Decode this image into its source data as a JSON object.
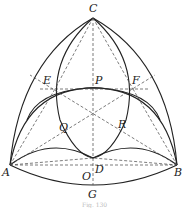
{
  "figure": {
    "caption": "Fig. 130",
    "points": {
      "A": {
        "label": "A",
        "x": 10,
        "y": 165
      },
      "B": {
        "label": "B",
        "x": 177,
        "y": 165
      },
      "C": {
        "label": "C",
        "x": 93,
        "y": 18
      },
      "D": {
        "label": "D",
        "x": 93,
        "y": 158
      },
      "E": {
        "label": "E",
        "x": 55,
        "y": 89
      },
      "F": {
        "label": "F",
        "x": 133,
        "y": 89
      },
      "P": {
        "label": "P",
        "x": 93,
        "y": 89
      },
      "Q": {
        "label": "Q",
        "x": 72,
        "y": 126
      },
      "R": {
        "label": "R",
        "x": 115,
        "y": 126
      },
      "O": {
        "label": "O",
        "x": 93,
        "y": 114
      },
      "G": {
        "label": "G",
        "x": 93,
        "y": 185
      }
    },
    "labels": [
      "C",
      "E",
      "P",
      "F",
      "Q",
      "R",
      "A",
      "B",
      "O",
      "D",
      "G"
    ]
  }
}
